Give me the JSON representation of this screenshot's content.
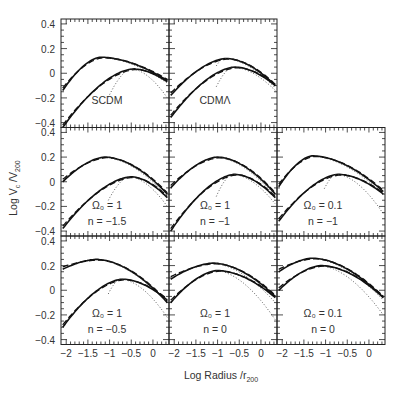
{
  "chart_data": {
    "type": "line",
    "title": "",
    "xlabel": "Log Radius /r_200",
    "ylabel": "Log V_c /V_200",
    "xlim": [
      -2.12,
      0.37
    ],
    "ylim": [
      -0.44,
      0.44
    ],
    "x_ticks": [
      -2,
      -1.5,
      -1,
      -0.5,
      0
    ],
    "x_tick_labels": [
      "-2",
      "-1.5",
      "-1",
      "-0.5",
      "0"
    ],
    "y_ticks": [
      -0.4,
      -0.2,
      0,
      0.2,
      0.4
    ],
    "y_tick_labels": [
      "-0.4",
      "-0.2",
      "0",
      "0.2",
      "0.4"
    ],
    "grid": false,
    "legend": null,
    "line_styles": [
      "solid (simulation)",
      "dashed (fit)",
      "long-dashed (fit)",
      "dotted (extrapolation)"
    ],
    "panels": [
      {
        "id": "scdm",
        "row": 0,
        "col": 0,
        "label_line1": "SCDM",
        "label_line2": "",
        "upper": {
          "peak_x": -1.2,
          "peak_y": 0.13,
          "left_y": -0.14,
          "right_y": -0.06,
          "dotted_right_y": -0.08
        },
        "lower": {
          "peak_x": -0.45,
          "peak_y": 0.035,
          "left_y": -0.44,
          "right_y": -0.07,
          "dotted_right_y": -0.2
        }
      },
      {
        "id": "cdm-lambda",
        "row": 0,
        "col": 1,
        "label_line1": "CDMΛ",
        "label_line2": "",
        "upper": {
          "peak_x": -0.8,
          "peak_y": 0.12,
          "left_y": -0.18,
          "right_y": -0.1,
          "dotted_right_y": -0.12
        },
        "lower": {
          "peak_x": -0.6,
          "peak_y": 0.05,
          "left_y": -0.36,
          "right_y": -0.1,
          "dotted_right_y": -0.14
        }
      },
      {
        "id": "o1-nm1.5",
        "row": 1,
        "col": 0,
        "label_line1": "Ω₀ = 1",
        "label_line2": "n = −1.5",
        "upper": {
          "peak_x": -1.1,
          "peak_y": 0.2,
          "left_y": 0.0,
          "right_y": -0.1,
          "dotted_right_y": -0.12
        },
        "lower": {
          "peak_x": -0.5,
          "peak_y": 0.04,
          "left_y": -0.38,
          "right_y": -0.13,
          "dotted_right_y": -0.2
        }
      },
      {
        "id": "o1-nm1",
        "row": 1,
        "col": 1,
        "label_line1": "Ω₀ = 1",
        "label_line2": "n = −1",
        "upper": {
          "peak_x": -1.0,
          "peak_y": 0.2,
          "left_y": -0.05,
          "right_y": -0.1,
          "dotted_right_y": -0.12
        },
        "lower": {
          "peak_x": -0.6,
          "peak_y": 0.06,
          "left_y": -0.4,
          "right_y": -0.13,
          "dotted_right_y": -0.18
        }
      },
      {
        "id": "o0.1-nm1",
        "row": 1,
        "col": 2,
        "label_line1": "Ω₀ = 0.1",
        "label_line2": "n = −1",
        "upper": {
          "peak_x": -1.3,
          "peak_y": 0.21,
          "left_y": -0.04,
          "right_y": -0.08,
          "dotted_right_y": -0.1
        },
        "lower": {
          "peak_x": -0.7,
          "peak_y": 0.06,
          "left_y": -0.32,
          "right_y": -0.1,
          "dotted_right_y": -0.26
        }
      },
      {
        "id": "o1-nm0.5",
        "row": 2,
        "col": 0,
        "label_line1": "Ω₀ = 1",
        "label_line2": "n = −0.5",
        "upper": {
          "peak_x": -1.3,
          "peak_y": 0.25,
          "left_y": 0.17,
          "right_y": -0.1,
          "dotted_right_y": -0.1
        },
        "lower": {
          "peak_x": -0.7,
          "peak_y": 0.09,
          "left_y": -0.3,
          "right_y": -0.08,
          "dotted_right_y": -0.22
        }
      },
      {
        "id": "o1-n0",
        "row": 2,
        "col": 1,
        "label_line1": "Ω₀ = 1",
        "label_line2": "n = 0",
        "upper": {
          "peak_x": -1.1,
          "peak_y": 0.22,
          "left_y": 0.09,
          "right_y": -0.05,
          "dotted_right_y": -0.1
        },
        "lower": {
          "peak_x": -1.0,
          "peak_y": 0.16,
          "left_y": -0.1,
          "right_y": -0.06,
          "dotted_right_y": -0.24
        }
      },
      {
        "id": "o0.1-n0",
        "row": 2,
        "col": 2,
        "label_line1": "Ω₀ = 0.1",
        "label_line2": "n = 0",
        "upper": {
          "peak_x": -1.3,
          "peak_y": 0.26,
          "left_y": 0.15,
          "right_y": -0.06,
          "dotted_right_y": -0.08
        },
        "lower": {
          "peak_x": -1.1,
          "peak_y": 0.2,
          "left_y": -0.0,
          "right_y": -0.06,
          "dotted_right_y": -0.2
        }
      }
    ]
  },
  "axes": {
    "ylabel_main": "Log V",
    "ylabel_sub1": "c",
    "ylabel_mid": " /V",
    "ylabel_sub2": "200",
    "xlabel_main": "Log Radius /r",
    "xlabel_sub": "200"
  }
}
